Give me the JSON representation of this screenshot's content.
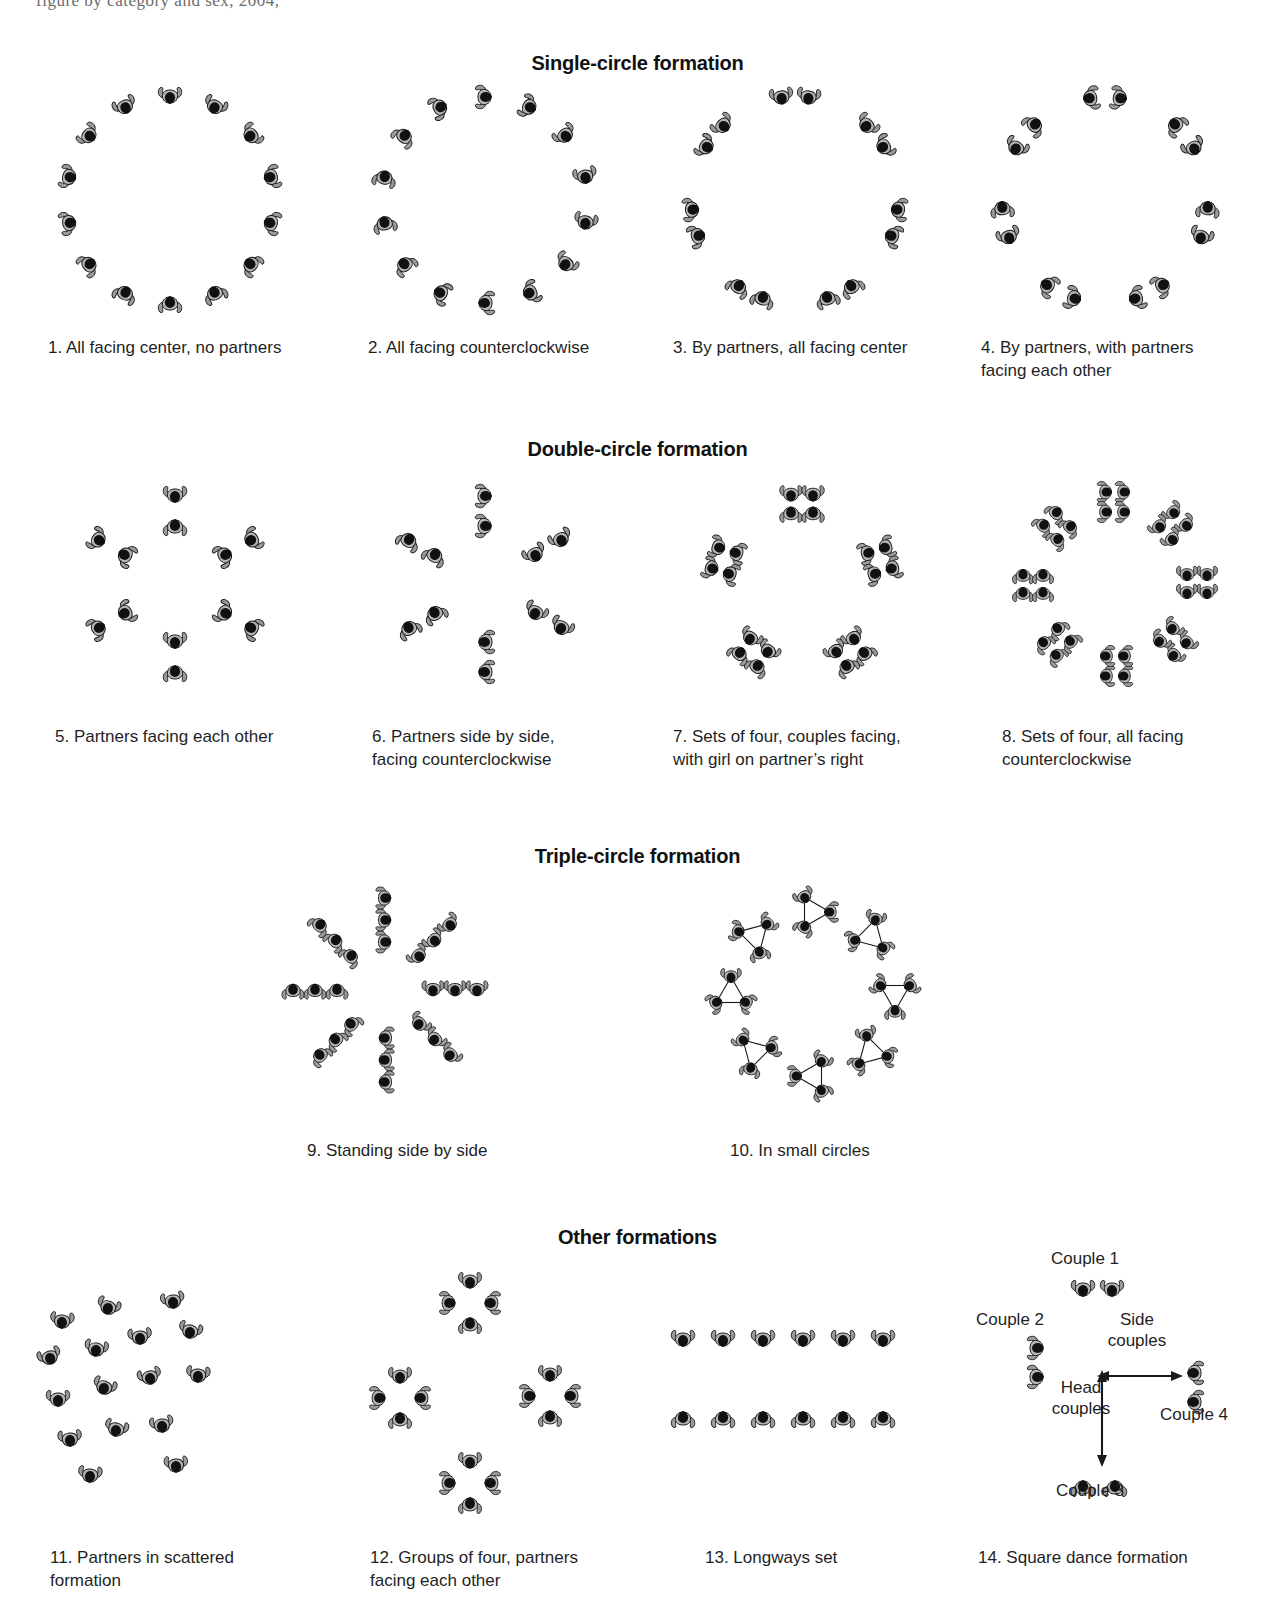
{
  "page": {
    "top_cut_text": "figure by category and sex, 2004,",
    "background": "#ffffff",
    "ink": "#1a1a1a"
  },
  "sections": [
    {
      "id": "single",
      "heading": "Single-circle formation"
    },
    {
      "id": "double",
      "heading": "Double-circle formation"
    },
    {
      "id": "triple",
      "heading": "Triple-circle formation"
    },
    {
      "id": "other",
      "heading": "Other formations"
    }
  ],
  "figures": [
    {
      "num": "1.",
      "caption": "1. All facing center, no partners",
      "type": "circle-single",
      "count": 14
    },
    {
      "num": "2.",
      "caption": "2. All facing counterclockwise",
      "type": "circle-single",
      "count": 14
    },
    {
      "num": "3.",
      "caption": "3. By partners, all facing center",
      "type": "circle-pairs",
      "count": 14
    },
    {
      "num": "4.",
      "caption": "4. By partners, with partners\nfacing each other",
      "type": "circle-pairs",
      "count": 14
    },
    {
      "num": "5.",
      "caption": "5. Partners facing each other",
      "type": "double-circle",
      "count": 12
    },
    {
      "num": "6.",
      "caption": "6. Partners side by side,\nfacing counterclockwise",
      "type": "double-circle",
      "count": 12
    },
    {
      "num": "7.",
      "caption": "7. Sets of four, couples facing,\nwith girl on partner’s right",
      "type": "sets-of-four",
      "count": 20
    },
    {
      "num": "8.",
      "caption": "8. Sets of four, all facing\ncounterclockwise",
      "type": "sets-of-four",
      "count": 32
    },
    {
      "num": "9.",
      "caption": "9. Standing side by side",
      "type": "triple-spokes",
      "count": 24
    },
    {
      "num": "10.",
      "caption": "10. In small circles",
      "type": "small-circles",
      "count": 24
    },
    {
      "num": "11.",
      "caption": "11. Partners in scattered\nformation",
      "type": "scattered",
      "count": 16
    },
    {
      "num": "12.",
      "caption": "12. Groups of four, partners\nfacing each other",
      "type": "groups-of-four",
      "count": 16
    },
    {
      "num": "13.",
      "caption": "13. Longways set",
      "type": "longways",
      "count": 12
    },
    {
      "num": "14.",
      "caption": "14. Square dance formation",
      "type": "square-dance",
      "count": 8
    }
  ],
  "square_dance": {
    "couple_1": "Couple 1",
    "couple_2": "Couple 2",
    "couple_3": "Couple 3",
    "couple_4": "Couple 4",
    "side_couples": "Side\ncouples",
    "head_couples": "Head\ncouples"
  }
}
